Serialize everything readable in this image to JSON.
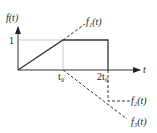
{
  "diagram": {
    "y_axis_label": "f(t)",
    "x_axis_label": "t",
    "y_tick_label": "1",
    "x_tick_labels": [
      "t₀",
      "2t₀"
    ],
    "curves": [
      {
        "name": "f1(t)",
        "label": "f₁(t)",
        "style": "dashed",
        "description": "ramp of slope 1/t0 extended beyond t0"
      },
      {
        "name": "f2(t)",
        "label": "f₂(t)",
        "style": "dashed",
        "description": "step of -1 starting at 2t0"
      },
      {
        "name": "f3(t)",
        "label": "f₃(t)",
        "style": "dashed",
        "description": "negative ramp starting at t0"
      },
      {
        "name": "f(t)",
        "label": "f(t)",
        "style": "solid",
        "description": "ramp from 0 to 1 over [0,t0], constant 1 until 2t0, then drops to 0"
      }
    ],
    "colors": {
      "line": "#333333",
      "axis": "#333333",
      "background": "#ffffff"
    }
  }
}
